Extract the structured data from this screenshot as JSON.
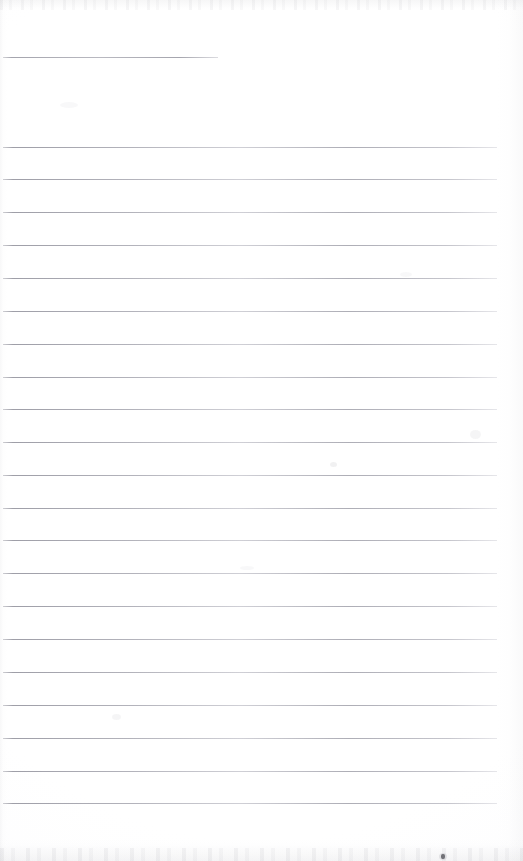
{
  "document": {
    "kind": "scanned-lined-notebook-page",
    "title": "Blank ruled page",
    "page_width": 523,
    "page_height": 861,
    "background_color": "#ffffff",
    "rule_color": "#a0a0aa",
    "content_text": "",
    "visible_text": []
  },
  "ruling": {
    "line_count": 22,
    "full_line_count": 21,
    "short_line_count": 1,
    "line_spacing": 32.85,
    "line_thickness": 1,
    "left_margin": 3,
    "right_margin": 497,
    "first_line_y": 57,
    "last_line_y": 803,
    "lines": [
      {
        "y": 57,
        "x1": 3,
        "x2": 218,
        "short": true
      },
      {
        "y": 146.5,
        "x1": 3,
        "x2": 497,
        "short": false
      },
      {
        "y": 179,
        "x1": 3,
        "x2": 497,
        "short": false
      },
      {
        "y": 212,
        "x1": 3,
        "x2": 497,
        "short": false
      },
      {
        "y": 245,
        "x1": 3,
        "x2": 497,
        "short": false
      },
      {
        "y": 277.5,
        "x1": 3,
        "x2": 497,
        "short": false
      },
      {
        "y": 310.5,
        "x1": 3,
        "x2": 497,
        "short": false
      },
      {
        "y": 343.5,
        "x1": 3,
        "x2": 497,
        "short": false
      },
      {
        "y": 376.5,
        "x1": 3,
        "x2": 497,
        "short": false
      },
      {
        "y": 409,
        "x1": 3,
        "x2": 497,
        "short": false
      },
      {
        "y": 442,
        "x1": 3,
        "x2": 497,
        "short": false
      },
      {
        "y": 474.5,
        "x1": 3,
        "x2": 497,
        "short": false
      },
      {
        "y": 507.5,
        "x1": 3,
        "x2": 497,
        "short": false
      },
      {
        "y": 540,
        "x1": 3,
        "x2": 497,
        "short": false
      },
      {
        "y": 573,
        "x1": 3,
        "x2": 497,
        "short": false
      },
      {
        "y": 606,
        "x1": 3,
        "x2": 497,
        "short": false
      },
      {
        "y": 639,
        "x1": 3,
        "x2": 497,
        "short": false
      },
      {
        "y": 672,
        "x1": 3,
        "x2": 497,
        "short": false
      },
      {
        "y": 705,
        "x1": 3,
        "x2": 497,
        "short": false
      },
      {
        "y": 737.5,
        "x1": 3,
        "x2": 497,
        "short": false
      },
      {
        "y": 770.5,
        "x1": 3,
        "x2": 497,
        "short": false
      },
      {
        "y": 803,
        "x1": 3,
        "x2": 497,
        "short": false
      }
    ]
  },
  "artifacts": {
    "ink_speck": {
      "x": 441,
      "y": 854,
      "color": "#4a4a50"
    },
    "smudges": [
      {
        "x": 330,
        "y": 462,
        "w": 7,
        "h": 5,
        "opacity": 0.1
      },
      {
        "x": 470,
        "y": 430,
        "w": 11,
        "h": 9,
        "opacity": 0.07
      },
      {
        "x": 112,
        "y": 714,
        "w": 9,
        "h": 6,
        "opacity": 0.07
      },
      {
        "x": 240,
        "y": 566,
        "w": 14,
        "h": 4,
        "opacity": 0.05
      },
      {
        "x": 60,
        "y": 102,
        "w": 18,
        "h": 6,
        "opacity": 0.05
      },
      {
        "x": 400,
        "y": 272,
        "w": 12,
        "h": 5,
        "opacity": 0.05
      }
    ]
  }
}
